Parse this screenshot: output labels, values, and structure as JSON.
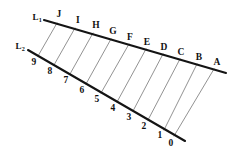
{
  "figure": {
    "background_color": "#ffffff",
    "line_color": "#141414",
    "connector_color": "#6e6e6e",
    "text_color": "#111111",
    "width": 240,
    "height": 162
  },
  "lines": {
    "top": {
      "name_base": "L",
      "name_sub": "1",
      "name_label_x": 37,
      "name_label_y": 17,
      "x1": 44,
      "y1": 20,
      "x2": 226,
      "y2": 73
    },
    "bottom": {
      "name_base": "L",
      "name_sub": "2",
      "name_label_x": 20,
      "name_label_y": 46,
      "x1": 28,
      "y1": 50,
      "x2": 185,
      "y2": 141
    }
  },
  "top_points": [
    {
      "label": "J",
      "x": 57,
      "y": 23,
      "lx": 59,
      "ly": 15
    },
    {
      "label": "I",
      "x": 75,
      "y": 28,
      "lx": 78,
      "ly": 21
    },
    {
      "label": "H",
      "x": 93,
      "y": 33,
      "lx": 96,
      "ly": 26
    },
    {
      "label": "G",
      "x": 111,
      "y": 39,
      "lx": 113,
      "ly": 32
    },
    {
      "label": "F",
      "x": 129,
      "y": 44,
      "lx": 130,
      "ly": 38
    },
    {
      "label": "E",
      "x": 146,
      "y": 49,
      "lx": 147,
      "ly": 43
    },
    {
      "label": "D",
      "x": 163,
      "y": 54,
      "lx": 164,
      "ly": 48
    },
    {
      "label": "C",
      "x": 180,
      "y": 59,
      "lx": 181,
      "ly": 53
    },
    {
      "label": "B",
      "x": 197,
      "y": 64,
      "lx": 199,
      "ly": 58
    },
    {
      "label": "A",
      "x": 214,
      "y": 69,
      "lx": 217,
      "ly": 63
    }
  ],
  "bottom_points": [
    {
      "label": "9",
      "x": 38,
      "y": 56,
      "lx": 34,
      "ly": 63
    },
    {
      "label": "8",
      "x": 54,
      "y": 65,
      "lx": 50,
      "ly": 72
    },
    {
      "label": "7",
      "x": 70,
      "y": 74,
      "lx": 66,
      "ly": 81
    },
    {
      "label": "6",
      "x": 86,
      "y": 84,
      "lx": 82,
      "ly": 91
    },
    {
      "label": "5",
      "x": 101,
      "y": 93,
      "lx": 97,
      "ly": 100
    },
    {
      "label": "4",
      "x": 117,
      "y": 102,
      "lx": 113,
      "ly": 109
    },
    {
      "label": "3",
      "x": 133,
      "y": 111,
      "lx": 129,
      "ly": 118
    },
    {
      "label": "2",
      "x": 148,
      "y": 120,
      "lx": 144,
      "ly": 127
    },
    {
      "label": "1",
      "x": 164,
      "y": 130,
      "lx": 160,
      "ly": 136
    },
    {
      "label": "0",
      "x": 174,
      "y": 136,
      "lx": 171,
      "ly": 144
    }
  ],
  "connectors": [
    {
      "from": "J",
      "to": "9",
      "x1": 57,
      "y1": 23,
      "x2": 38,
      "y2": 56
    },
    {
      "from": "I",
      "to": "8",
      "x1": 75,
      "y1": 28,
      "x2": 54,
      "y2": 65
    },
    {
      "from": "H",
      "to": "7",
      "x1": 93,
      "y1": 33,
      "x2": 70,
      "y2": 74
    },
    {
      "from": "G",
      "to": "6",
      "x1": 111,
      "y1": 39,
      "x2": 86,
      "y2": 84
    },
    {
      "from": "F",
      "to": "5",
      "x1": 129,
      "y1": 44,
      "x2": 101,
      "y2": 93
    },
    {
      "from": "E",
      "to": "4",
      "x1": 146,
      "y1": 49,
      "x2": 117,
      "y2": 102
    },
    {
      "from": "D",
      "to": "3",
      "x1": 163,
      "y1": 54,
      "x2": 133,
      "y2": 111
    },
    {
      "from": "C",
      "to": "2",
      "x1": 180,
      "y1": 59,
      "x2": 148,
      "y2": 120
    },
    {
      "from": "B",
      "to": "1",
      "x1": 197,
      "y1": 64,
      "x2": 164,
      "y2": 130
    },
    {
      "from": "A",
      "to": "0",
      "x1": 214,
      "y1": 69,
      "x2": 174,
      "y2": 136
    }
  ]
}
